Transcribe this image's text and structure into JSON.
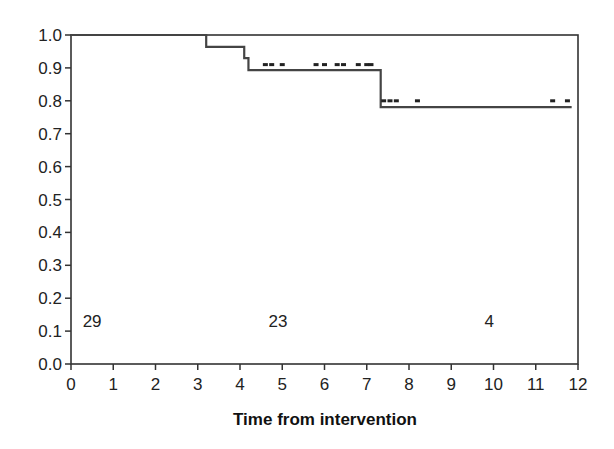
{
  "chart_data": {
    "type": "line",
    "subtype": "kaplan-meier-step",
    "title": "",
    "xlabel": "Time from intervention",
    "ylabel": "",
    "xlim": [
      0,
      12
    ],
    "ylim": [
      0.0,
      1.0
    ],
    "x_ticks": [
      "0",
      "1",
      "2",
      "3",
      "4",
      "5",
      "6",
      "7",
      "8",
      "9",
      "10",
      "11",
      "12"
    ],
    "y_ticks": [
      "0.0",
      "0.1",
      "0.2",
      "0.3",
      "0.4",
      "0.5",
      "0.6",
      "0.7",
      "0.8",
      "0.9",
      "1.0"
    ],
    "grid": false,
    "legend": null,
    "series": [
      {
        "name": "Survival",
        "steps": [
          {
            "t": 0.0,
            "s": 1.0
          },
          {
            "t": 3.2,
            "s": 0.964
          },
          {
            "t": 4.1,
            "s": 0.93
          },
          {
            "t": 4.2,
            "s": 0.893
          },
          {
            "t": 7.33,
            "s": 0.781
          },
          {
            "t": 11.85,
            "s": 0.781
          }
        ],
        "censor_marks": [
          {
            "t": 4.6,
            "s": 0.91
          },
          {
            "t": 4.75,
            "s": 0.91
          },
          {
            "t": 5.0,
            "s": 0.91
          },
          {
            "t": 5.8,
            "s": 0.91
          },
          {
            "t": 6.0,
            "s": 0.91
          },
          {
            "t": 6.3,
            "s": 0.91
          },
          {
            "t": 6.45,
            "s": 0.91
          },
          {
            "t": 6.8,
            "s": 0.91
          },
          {
            "t": 7.0,
            "s": 0.91
          },
          {
            "t": 7.1,
            "s": 0.91
          },
          {
            "t": 7.4,
            "s": 0.8
          },
          {
            "t": 7.55,
            "s": 0.8
          },
          {
            "t": 7.7,
            "s": 0.8
          },
          {
            "t": 8.2,
            "s": 0.8
          },
          {
            "t": 11.4,
            "s": 0.8
          },
          {
            "t": 11.75,
            "s": 0.8
          }
        ]
      }
    ],
    "annotations": [
      {
        "text": "29",
        "t": 0.5,
        "s": 0.13
      },
      {
        "text": "23",
        "t": 4.9,
        "s": 0.13
      },
      {
        "text": "4",
        "t": 9.9,
        "s": 0.13
      }
    ]
  }
}
